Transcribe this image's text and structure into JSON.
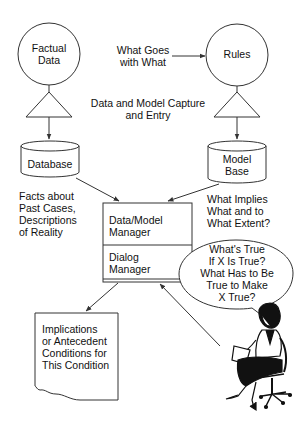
{
  "diagram": {
    "nodes": {
      "factual_data": {
        "label_line1": "Factual",
        "label_line2": "Data",
        "shape": "circle"
      },
      "rules": {
        "label": "Rules",
        "shape": "circle"
      },
      "database": {
        "label": "Database",
        "shape": "cylinder"
      },
      "model_base": {
        "label_line1": "Model",
        "label_line2": "Base",
        "shape": "cylinder"
      },
      "manager_box": {
        "top_line1": "Data/Model",
        "top_line2": "Manager",
        "bottom_line1": "Dialog",
        "bottom_line2": "Manager"
      },
      "output_document": {
        "line1": "Implications",
        "line2": "or Antecedent",
        "line3": "Conditions for",
        "line4": "This Condition",
        "shape": "document"
      },
      "speech_bubble": {
        "line1": "What's True",
        "line2": "If X Is True?",
        "line3": "What Has to Be",
        "line4": "True to Make",
        "line5": "X True?"
      },
      "user_figure": {
        "icon": "seated-woman-icon"
      }
    },
    "annotations": {
      "what_goes": {
        "line1": "What Goes",
        "line2": "with What"
      },
      "capture": {
        "line1": "Data and Model Capture",
        "line2": "and Entry"
      },
      "facts": {
        "line1": "Facts about",
        "line2": "Past Cases,",
        "line3": "Descriptions",
        "line4": "of Reality"
      },
      "implies": {
        "line1": "What Implies",
        "line2": "What and to",
        "line3": "What Extent?"
      }
    },
    "colors": {
      "stroke": "#333333",
      "background": "#ffffff",
      "text": "#111111"
    }
  }
}
